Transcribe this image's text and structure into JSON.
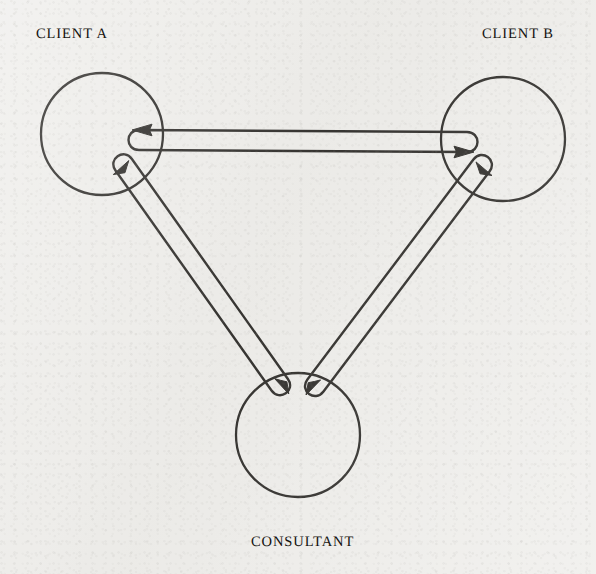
{
  "diagram": {
    "type": "node-link-diagram",
    "background_color": "#eeedea",
    "ink_color": "#14120f",
    "nodes": [
      {
        "id": "client_a",
        "label": "CLIENT A",
        "shape": "circle",
        "cx": 102,
        "cy": 134,
        "r": 61
      },
      {
        "id": "client_b",
        "label": "CLIENT B",
        "shape": "circle",
        "cx": 503,
        "cy": 139,
        "r": 62
      },
      {
        "id": "consultant",
        "label": "CONSULTANT",
        "shape": "circle",
        "cx": 298,
        "cy": 435,
        "r": 62
      }
    ],
    "edges": [
      {
        "id": "edge_a_b",
        "from": "client_a",
        "to": "client_b",
        "style": "double-line-bidirectional",
        "arrowheads": [
          "client_a",
          "client_b"
        ],
        "description": "Horizontal bidirectional link between CLIENT A and CLIENT B"
      },
      {
        "id": "edge_a_consultant",
        "from": "client_a",
        "to": "consultant",
        "style": "double-line-bidirectional",
        "arrowheads": [
          "client_a",
          "consultant"
        ],
        "description": "Diagonal bidirectional link between CLIENT A and CONSULTANT"
      },
      {
        "id": "edge_b_consultant",
        "from": "client_b",
        "to": "consultant",
        "style": "double-line-bidirectional",
        "arrowheads": [
          "client_b",
          "consultant"
        ],
        "description": "Diagonal bidirectional link between CLIENT B and CONSULTANT"
      }
    ]
  },
  "labels": {
    "client_a": "CLIENT A",
    "client_b": "CLIENT B",
    "consultant": "CONSULTANT"
  }
}
